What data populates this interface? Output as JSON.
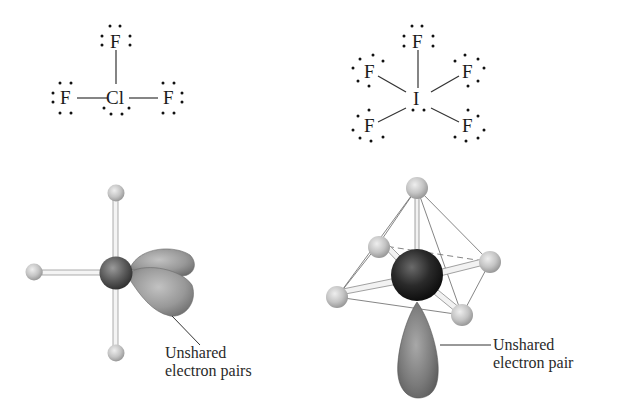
{
  "figure": {
    "left_molecule": {
      "name": "ClF3",
      "lewis": {
        "central_atom": "Cl",
        "top_atom": "F",
        "left_atom": "F",
        "right_atom": "F"
      },
      "model": {
        "label_line1": "Unshared",
        "label_line2": "electron pairs"
      }
    },
    "right_molecule": {
      "name": "IF5",
      "lewis": {
        "central_atom": "I",
        "top_atom": "F",
        "upper_left_atom": "F",
        "upper_right_atom": "F",
        "lower_left_atom": "F",
        "lower_right_atom": "F"
      },
      "model": {
        "label_line1": "Unshared",
        "label_line2": "electron pair"
      }
    },
    "colors": {
      "background": "#ffffff",
      "outer_atom": "#c8c8c8",
      "central_atom_left": "#555555",
      "central_atom_right": "#222222",
      "lone_pair_lobe": "#8a8a8a",
      "text": "#1a1a1a"
    }
  }
}
